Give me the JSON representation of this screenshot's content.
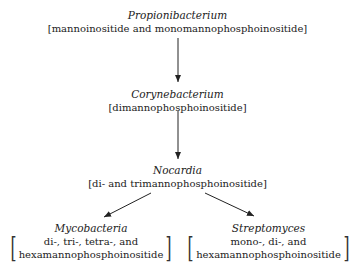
{
  "nodes": {
    "propionibacterium": {
      "title": "Propionibacterium",
      "content": "[mannoinositide and monomannophosphoinositide]"
    },
    "corynebacterium": {
      "title": "Corynebacterium",
      "content": "[dimannophosphoinositide]"
    },
    "nocardia": {
      "title": "Nocardia",
      "content": "[di- and trimannophosphoinositide]"
    },
    "mycobacteria": {
      "title": "Mycobacteria",
      "line1": "di-, tri-, tetra-, and",
      "line2": "hexamannophosphoinositide",
      "bracket_left": "[",
      "bracket_right": "]"
    },
    "streptomyces": {
      "title": "Streptomyces",
      "line1": "mono-, di-, and",
      "line2": "hexamannophosphoinositide",
      "bracket_left": "[",
      "bracket_right": "]"
    }
  },
  "edges": [
    {
      "from": "propionibacterium",
      "to": "corynebacterium"
    },
    {
      "from": "corynebacterium",
      "to": "nocardia"
    },
    {
      "from": "nocardia",
      "to": "mycobacteria"
    },
    {
      "from": "nocardia",
      "to": "streptomyces"
    }
  ]
}
